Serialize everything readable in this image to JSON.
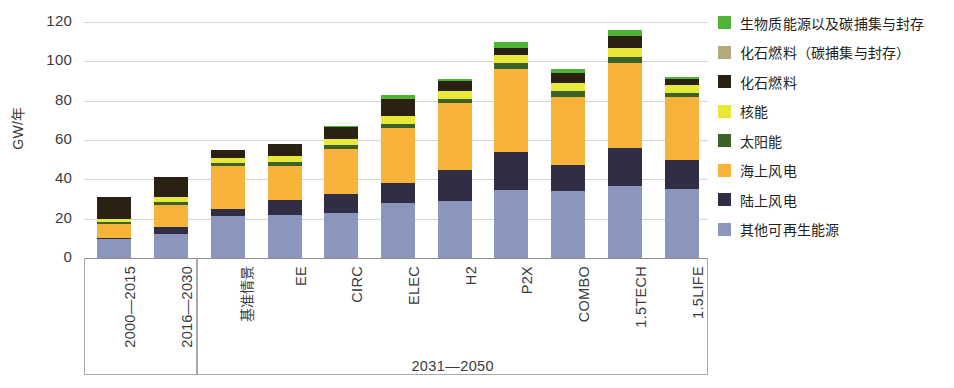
{
  "chart_data": {
    "type": "bar",
    "stacked": true,
    "title": "",
    "xlabel": "",
    "ylabel": "GW/年",
    "ylim": [
      0,
      120
    ],
    "yticks": [
      0,
      20,
      40,
      60,
      80,
      100,
      120
    ],
    "grid": true,
    "legend_position": "right",
    "categories": [
      "2000—2015",
      "2016—2030",
      "基准情景",
      "EE",
      "CIRC",
      "ELEC",
      "H2",
      "P2X",
      "COMBO",
      "1.5TECH",
      "1.5LIFE"
    ],
    "group_labels": [
      {
        "label": "",
        "categories": [
          "2000—2015",
          "2016—2030"
        ]
      },
      {
        "label": "2031—2050",
        "categories": [
          "基准情景",
          "EE",
          "CIRC",
          "ELEC",
          "H2",
          "P2X",
          "COMBO",
          "1.5TECH",
          "1.5LIFE"
        ]
      }
    ],
    "series": [
      {
        "name": "其他可再生能源",
        "color": "#8b96bd",
        "values": [
          9.5,
          12.0,
          21.5,
          22.0,
          23.0,
          28.0,
          29.0,
          34.5,
          34.0,
          36.5,
          35.0
        ]
      },
      {
        "name": "陆上风电",
        "color": "#2f2e44",
        "values": [
          0.8,
          4.0,
          3.5,
          7.5,
          9.5,
          10.0,
          16.0,
          19.5,
          13.5,
          19.5,
          15.0
        ]
      },
      {
        "name": "海上风电",
        "color": "#f7b33a",
        "values": [
          7.0,
          11.0,
          22.0,
          17.5,
          23.0,
          28.0,
          34.0,
          42.0,
          34.5,
          43.0,
          32.0
        ]
      },
      {
        "name": "太阳能",
        "color": "#3c6327",
        "values": [
          1.2,
          1.5,
          1.5,
          2.0,
          2.0,
          2.0,
          2.0,
          3.0,
          3.0,
          3.0,
          2.0
        ]
      },
      {
        "name": "核能",
        "color": "#e8e83a",
        "values": [
          1.5,
          2.5,
          2.5,
          3.0,
          3.0,
          4.0,
          4.0,
          4.0,
          4.0,
          5.0,
          4.0
        ]
      },
      {
        "name": "化石燃料",
        "color": "#2b2113",
        "values": [
          11.0,
          10.0,
          4.0,
          6.0,
          6.0,
          9.0,
          5.0,
          4.0,
          5.0,
          6.0,
          3.0
        ]
      },
      {
        "name": "化石燃料（碳捕集与封存）",
        "color": "#b3ab7c",
        "values": [
          0,
          0,
          0,
          0,
          0,
          0,
          0,
          0,
          0,
          0,
          0
        ]
      },
      {
        "name": "生物质能源以及碳捕集与封存",
        "color": "#4fb335",
        "values": [
          0,
          0,
          0,
          0,
          0.5,
          2.0,
          1.0,
          3.0,
          2.0,
          3.0,
          1.0
        ]
      }
    ],
    "totals": [
      31,
      41,
      55,
      58,
      67,
      83,
      91,
      110,
      96,
      116,
      92
    ]
  },
  "axis": {
    "y_title": "GW/年",
    "y_tick_labels": [
      "120",
      "100",
      "80",
      "60",
      "40",
      "20",
      "0"
    ]
  },
  "legend": {
    "items": [
      {
        "label": "生物质能源以及碳捕集与封存",
        "color": "#4fb335",
        "icon": "legend-swatch-beccs"
      },
      {
        "label": "化石燃料（碳捕集与封存）",
        "color": "#b3ab7c",
        "icon": "legend-swatch-fossil-ccs"
      },
      {
        "label": "化石燃料",
        "color": "#2b2113",
        "icon": "legend-swatch-fossil"
      },
      {
        "label": "核能",
        "color": "#e8e83a",
        "icon": "legend-swatch-nuclear"
      },
      {
        "label": "太阳能",
        "color": "#3c6327",
        "icon": "legend-swatch-solar"
      },
      {
        "label": "海上风电",
        "color": "#f7b33a",
        "icon": "legend-swatch-offshore-wind"
      },
      {
        "label": "陆上风电",
        "color": "#2f2e44",
        "icon": "legend-swatch-onshore-wind"
      },
      {
        "label": "其他可再生能源",
        "color": "#8b96bd",
        "icon": "legend-swatch-other-renewables"
      }
    ]
  },
  "x_axis": {
    "labels": [
      "2000—2015",
      "2016—2030",
      "基准情景",
      "EE",
      "CIRC",
      "ELEC",
      "H2",
      "P2X",
      "COMBO",
      "1.5TECH",
      "1.5LIFE"
    ],
    "group_label": "2031—2050"
  }
}
